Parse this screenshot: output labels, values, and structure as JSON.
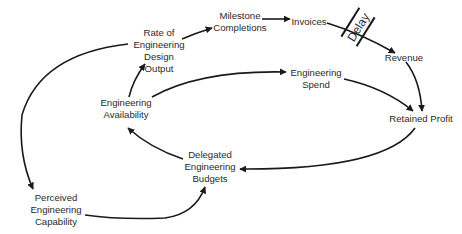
{
  "diagram": {
    "type": "causal-loop",
    "nodes": {
      "rate_output": {
        "lines": [
          "Rate of",
          "Engineering",
          "Design",
          "Output"
        ]
      },
      "milestones": {
        "lines": [
          "Milestone",
          "Completions"
        ]
      },
      "invoices": {
        "lines": [
          "Invoices"
        ]
      },
      "revenue": {
        "lines": [
          "Revenue"
        ]
      },
      "eng_spend": {
        "lines": [
          "Engineering",
          "Spend"
        ]
      },
      "retained_profit": {
        "lines": [
          "Retained Profit"
        ]
      },
      "eng_availability": {
        "lines": [
          "Engineering",
          "Availability"
        ]
      },
      "delegated_budgets": {
        "lines": [
          "Delegated",
          "Engineering",
          "Budgets"
        ]
      },
      "perceived_capability": {
        "lines": [
          "Perceived",
          "Engineering",
          "Capability"
        ]
      }
    },
    "delay_label": "Delay",
    "edges": [
      {
        "from": "Rate of Engineering Design Output",
        "to": "Milestone Completions"
      },
      {
        "from": "Milestone Completions",
        "to": "Invoices"
      },
      {
        "from": "Invoices",
        "to": "Revenue",
        "delay": true
      },
      {
        "from": "Revenue",
        "to": "Retained Profit"
      },
      {
        "from": "Engineering Availability",
        "to": "Engineering Spend"
      },
      {
        "from": "Engineering Spend",
        "to": "Retained Profit"
      },
      {
        "from": "Retained Profit",
        "to": "Delegated Engineering Budgets"
      },
      {
        "from": "Delegated Engineering Budgets",
        "to": "Engineering Availability"
      },
      {
        "from": "Engineering Availability",
        "to": "Rate of Engineering Design Output"
      },
      {
        "from": "Rate of Engineering Design Output",
        "to": "Perceived Engineering Capability"
      },
      {
        "from": "Perceived Engineering Capability",
        "to": "Delegated Engineering Budgets"
      }
    ]
  }
}
